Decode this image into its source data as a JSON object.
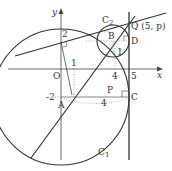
{
  "diagram": {
    "axes": {
      "x_label": "x",
      "y_label": "y",
      "origin_label": "O"
    },
    "ticks": {
      "x": [
        "1",
        "4",
        "5"
      ],
      "y": [
        "2",
        "-2"
      ]
    },
    "points": {
      "A": "A",
      "B": "B",
      "C": "C",
      "D": "D",
      "P": "P",
      "Q": "Q (5, p)"
    },
    "curves": {
      "C1": "C",
      "C1_sub": "1",
      "C2": "C",
      "C2_sub": "2"
    },
    "annotations": {
      "distance_AC": "4",
      "radius_small": "1"
    },
    "colors": {
      "line": "#333333",
      "dotted": "#777777",
      "background": "#ffffff"
    }
  }
}
